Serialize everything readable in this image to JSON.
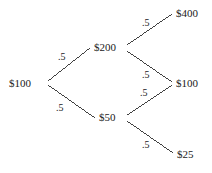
{
  "diagram": {
    "type": "binomial-price-tree",
    "width": 212,
    "height": 173,
    "background_color": "#ffffff",
    "line_color": "#2b2b2b",
    "text_color": "#1a1a1a",
    "nodes": [
      {
        "id": "root",
        "label": "$100",
        "x": 9,
        "y": 78,
        "anchor_x": 47,
        "anchor_y": 83
      },
      {
        "id": "up",
        "label": "$200",
        "x": 94,
        "y": 42,
        "anchor_x": 126,
        "anchor_y": 48
      },
      {
        "id": "down",
        "label": "$50",
        "x": 99,
        "y": 112,
        "anchor_x": 126,
        "anchor_y": 118
      },
      {
        "id": "upup",
        "label": "$400",
        "x": 176,
        "y": 8,
        "anchor_x": 173,
        "anchor_y": 13
      },
      {
        "id": "updown",
        "label": "$100",
        "x": 176,
        "y": 78,
        "anchor_x": 172,
        "anchor_y": 83
      },
      {
        "id": "downdown",
        "label": "$25",
        "x": 177,
        "y": 149,
        "anchor_x": 173,
        "anchor_y": 154
      }
    ],
    "edges": [
      {
        "id": "root-up",
        "from": "root",
        "to": "up",
        "x1": 48,
        "y1": 81,
        "x2": 90,
        "y2": 48
      },
      {
        "id": "root-down",
        "from": "root",
        "to": "down",
        "x1": 48,
        "y1": 85,
        "x2": 95,
        "y2": 118
      },
      {
        "id": "up-upup",
        "from": "up",
        "to": "upup",
        "x1": 127,
        "y1": 45,
        "x2": 172,
        "y2": 14
      },
      {
        "id": "up-updown",
        "from": "up",
        "to": "updown",
        "x1": 127,
        "y1": 51,
        "x2": 172,
        "y2": 82
      },
      {
        "id": "down-updown",
        "from": "down",
        "to": "updown",
        "x1": 127,
        "y1": 115,
        "x2": 172,
        "y2": 85
      },
      {
        "id": "down-downdown",
        "from": "down",
        "to": "downdown",
        "x1": 127,
        "y1": 121,
        "x2": 173,
        "y2": 153
      }
    ],
    "probabilities": [
      {
        "id": "p-root-up",
        "edge": "root-up",
        "label": ".5",
        "x": 58,
        "y": 52
      },
      {
        "id": "p-root-down",
        "edge": "root-down",
        "label": ".5",
        "x": 56,
        "y": 103
      },
      {
        "id": "p-up-upup",
        "edge": "up-upup",
        "label": ".5",
        "x": 142,
        "y": 18
      },
      {
        "id": "p-up-updown",
        "edge": "up-updown",
        "label": ".5",
        "x": 142,
        "y": 70
      },
      {
        "id": "p-down-updown",
        "edge": "down-updown",
        "label": ".5",
        "x": 140,
        "y": 88
      },
      {
        "id": "p-down-downdown",
        "edge": "down-downdown",
        "label": ".5",
        "x": 142,
        "y": 140
      }
    ]
  }
}
